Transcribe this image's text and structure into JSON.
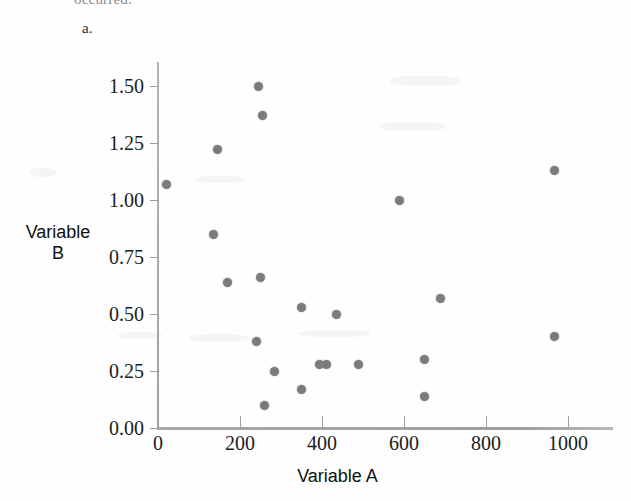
{
  "page": {
    "cutoff_text": "occurred.",
    "part_label": "a."
  },
  "chart_data": {
    "type": "scatter",
    "title": "",
    "xlabel": "Variable A",
    "ylabel": "Variable B",
    "ylabel_lines": [
      "Variable",
      "B"
    ],
    "xlim": [
      0,
      1110
    ],
    "ylim": [
      0.0,
      1.6
    ],
    "grid": false,
    "legend": null,
    "marker_color": "#7b7b7b",
    "marker_size_px": 9,
    "xticks": [
      0,
      200,
      400,
      600,
      800,
      1000
    ],
    "xtick_labels": [
      "0",
      "200",
      "400",
      "600",
      "800",
      "1000"
    ],
    "yticks": [
      0.0,
      0.25,
      0.5,
      0.75,
      1.0,
      1.25,
      1.5
    ],
    "ytick_labels": [
      "0.00",
      "0.25",
      "0.50",
      "0.75",
      "1.00",
      "1.25",
      "1.50"
    ],
    "points": [
      {
        "x": 20,
        "y": 1.07
      },
      {
        "x": 135,
        "y": 0.85
      },
      {
        "x": 145,
        "y": 1.22
      },
      {
        "x": 170,
        "y": 0.64
      },
      {
        "x": 240,
        "y": 0.38
      },
      {
        "x": 245,
        "y": 1.5
      },
      {
        "x": 250,
        "y": 0.66
      },
      {
        "x": 255,
        "y": 1.37
      },
      {
        "x": 260,
        "y": 0.1
      },
      {
        "x": 285,
        "y": 0.25
      },
      {
        "x": 350,
        "y": 0.53
      },
      {
        "x": 350,
        "y": 0.17
      },
      {
        "x": 395,
        "y": 0.28
      },
      {
        "x": 410,
        "y": 0.28
      },
      {
        "x": 435,
        "y": 0.5
      },
      {
        "x": 490,
        "y": 0.28
      },
      {
        "x": 590,
        "y": 1.0
      },
      {
        "x": 650,
        "y": 0.3
      },
      {
        "x": 650,
        "y": 0.14
      },
      {
        "x": 690,
        "y": 0.57
      },
      {
        "x": 968,
        "y": 1.13
      },
      {
        "x": 968,
        "y": 0.4
      }
    ]
  },
  "axes_geometry": {
    "origin_px_x": 158,
    "origin_px_y": 428,
    "x_px_per_unit": 0.41,
    "y_px_per_unit": 228.0
  }
}
